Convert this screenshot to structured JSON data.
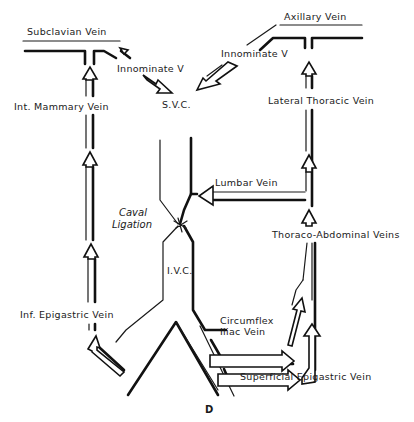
{
  "figure": {
    "panel_label": "D",
    "labels": {
      "subclavian_vein": "Subclavian Vein",
      "axillary_vein": "Axillary Vein",
      "innominate_left": "Innominate V",
      "innominate_right": "Innominate V",
      "svc": "S.V.C.",
      "int_mammary_vein": "Int. Mammary Vein",
      "lateral_thoracic_vein": "Lateral Thoracic Vein",
      "lumbar_vein": "Lumbar Vein",
      "caval_ligation_line1": "Caval",
      "caval_ligation_line2": "Ligation",
      "thoraco_abdominal_veins": "Thoraco-Abdominal Veins",
      "ivc": "I.V.C.",
      "inf_epigastric_vein": "Inf. Epigastric Vein",
      "circumflex_iliac_line1": "Circumflex",
      "circumflex_iliac_line2": "Iliac Vein",
      "superficial_epigastric_vein": "Superficial Epigastric Vein"
    },
    "colors": {
      "ink": "#111111",
      "background": "#ffffff"
    }
  }
}
